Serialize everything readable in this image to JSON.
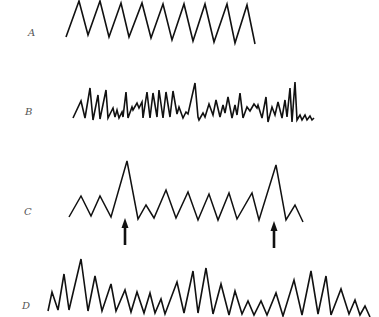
{
  "figure": {
    "traces": [
      {
        "label": "A",
        "label_pos": [
          28,
          28
        ],
        "points": "66,37 79,1 88,35 100,1 109,37 121,3 129,37 142,3 151,38 163,4 172,40 184,4 193,41 205,4 214,42 227,4 235,43 247,5 255,44"
      },
      {
        "label": "B",
        "label_pos": [
          26,
          107
        ],
        "points": "73,118 81,101 85,118 90,88 93,120 98,95 100,119 106,90 108,118 113,108 115,117 117,110 119,118 122,112 123,117 126,92 128,118 132,107 133,110 137,103 139,108 142,102 143,118 147,92 150,118 153,93 157,117 159,90 163,118 166,92 170,117 173,91 177,114 179,107 183,118 186,112 188,114 195,83 198,117 199,120 203,113 205,117 209,104 213,115 216,100 220,117 223,105 225,113 228,97 232,118 235,105 237,115 240,93 243,118 247,107 250,111 254,104 257,108 258,105 262,118 266,97 268,122 272,107 275,115 278,102 282,118 285,100 287,117 290,88 292,122 295,82 297,120 300,115 302,120 305,115 307,120 310,116 312,120 314,118"
      },
      {
        "label": "C",
        "label_pos": [
          24,
          207
        ],
        "points": "69,217 81,196 91,216 100,196 111,217 127,161 138,219 146,205 154,218 166,190 176,218 188,192 198,220 209,194 218,220 229,193 237,219 252,193 259,220 276,165 286,220 295,205 303,222",
        "arrows": [
          {
            "x": 125,
            "tip_y": 218,
            "base_y": 245
          },
          {
            "x": 274,
            "tip_y": 221,
            "base_y": 248
          }
        ]
      },
      {
        "label": "D",
        "label_pos": [
          22,
          301
        ],
        "points": "48,311 52,292 58,310 64,274 69,310 81,259 88,311 95,276 102,311 111,284 116,311 125,290 131,312 137,292 144,313 150,293 155,313 161,299 165,314 177,282 184,313 193,271 198,313 206,268 213,314 221,284 229,315 235,291 242,314 248,301 254,315 261,301 267,315 276,293 283,316 294,280 302,315 311,271 318,314 326,276 331,315 341,289 349,314 355,300 360,315 365,306 370,317"
      }
    ],
    "stroke_color": "#111111",
    "label_color": "#555555"
  }
}
